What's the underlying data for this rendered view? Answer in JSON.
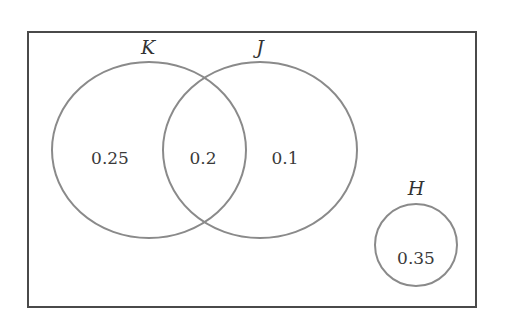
{
  "diagram": {
    "type": "venn",
    "colors": {
      "universe_border": "#4a4a4a",
      "circle_stroke": "#8a8a8a",
      "text": "#333333"
    },
    "sets": [
      {
        "name": "K",
        "label": "K"
      },
      {
        "name": "J",
        "label": "J"
      },
      {
        "name": "H",
        "label": "H"
      }
    ],
    "regions": {
      "k_only": "0.25",
      "k_and_j": "0.2",
      "j_only": "0.1",
      "h_only": "0.35"
    }
  }
}
